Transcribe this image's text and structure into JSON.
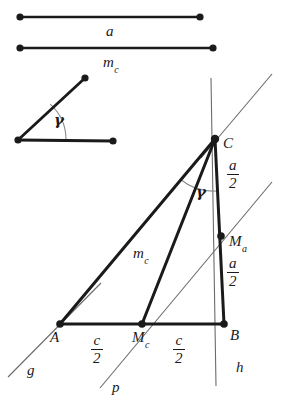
{
  "figure": {
    "colors": {
      "ink": "#1a1a1a",
      "thin_line": "#6b6b6b",
      "background": "#ffffff"
    }
  },
  "given_segments": [
    {
      "name": "segment-a",
      "label": "a",
      "label_pos": {
        "x": 106,
        "y": 24
      },
      "from": {
        "x": 20,
        "y": 17
      },
      "to": {
        "x": 200,
        "y": 17
      }
    },
    {
      "name": "segment-mc",
      "label": "m",
      "label_sub": "c",
      "label_pos": {
        "x": 103,
        "y": 55
      },
      "from": {
        "x": 20,
        "y": 48
      },
      "to": {
        "x": 213,
        "y": 48
      }
    }
  ],
  "given_angle": {
    "name": "angle-gamma",
    "label": "γ",
    "label_pos": {
      "x": 54,
      "y": 113
    },
    "vertex": {
      "x": 18,
      "y": 140
    },
    "ray_a_end": {
      "x": 85,
      "y": 78
    },
    "ray_b_end": {
      "x": 113,
      "y": 141
    },
    "arc_radius": 48
  },
  "triangle": {
    "name": "triangle-abc",
    "vertices": {
      "A": {
        "x": 60,
        "y": 324,
        "label": "A",
        "label_pos": {
          "x": 50,
          "y": 330
        }
      },
      "B": {
        "x": 224,
        "y": 324,
        "label": "B",
        "label_pos": {
          "x": 230,
          "y": 328
        }
      },
      "C": {
        "x": 215,
        "y": 139,
        "label": "C",
        "label_pos": {
          "x": 223,
          "y": 136
        }
      }
    },
    "midpoints": {
      "Mc": {
        "x": 142,
        "y": 324,
        "label": "M",
        "label_sub": "c",
        "label_pos": {
          "x": 132,
          "y": 330
        }
      },
      "Ma": {
        "x": 221,
        "y": 236,
        "label": "M",
        "label_sub": "a",
        "label_pos": {
          "x": 229,
          "y": 234
        }
      }
    },
    "median": {
      "name": "median-mc",
      "label": "m",
      "label_sub": "c",
      "label_pos": {
        "x": 133,
        "y": 246
      }
    },
    "interior_angle": {
      "name": "angle-gamma-at-c",
      "label": "γ",
      "label_pos": {
        "x": 196,
        "y": 185
      },
      "arc_radius": 52
    }
  },
  "measure_labels": [
    {
      "name": "label-a-over-2-upper",
      "num": "a",
      "den": "2",
      "pos": {
        "x": 227,
        "y": 158
      }
    },
    {
      "name": "label-a-over-2-lower",
      "num": "a",
      "den": "2",
      "pos": {
        "x": 227,
        "y": 256
      }
    },
    {
      "name": "label-c-over-2-left",
      "num": "c",
      "den": "2",
      "pos": {
        "x": 91,
        "y": 333
      }
    },
    {
      "name": "label-c-over-2-right",
      "num": "c",
      "den": "2",
      "pos": {
        "x": 173,
        "y": 333
      }
    }
  ],
  "construction_lines": [
    {
      "name": "line-g",
      "label": "g",
      "label_pos": {
        "x": 27,
        "y": 363
      },
      "from": {
        "x": 8,
        "y": 377
      },
      "to": {
        "x": 101,
        "y": 283
      }
    },
    {
      "name": "line-p",
      "label": "p",
      "label_pos": {
        "x": 112,
        "y": 380
      },
      "from": {
        "x": 100,
        "y": 388
      },
      "to": {
        "x": 272,
        "y": 182
      }
    },
    {
      "name": "line-h",
      "label": "h",
      "label_pos": {
        "x": 236,
        "y": 360
      },
      "from": {
        "x": 211,
        "y": 78
      },
      "to": {
        "x": 216,
        "y": 386
      }
    },
    {
      "name": "line-parallel-through-c",
      "from": {
        "x": 201,
        "y": 158
      },
      "to": {
        "x": 272,
        "y": 74
      }
    }
  ]
}
